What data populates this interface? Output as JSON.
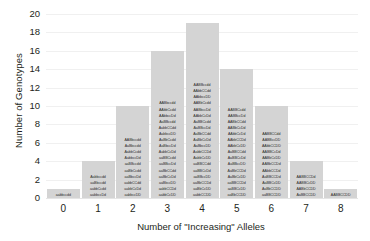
{
  "chart_data": {
    "type": "bar",
    "title": "",
    "xlabel": "Number of \"Increasing\" Alleles",
    "ylabel": "Number of Genotypes",
    "categories": [
      "0",
      "1",
      "2",
      "3",
      "4",
      "5",
      "6",
      "7",
      "8"
    ],
    "values": [
      1,
      4,
      10,
      16,
      19,
      14,
      10,
      4,
      1
    ],
    "ylim": [
      0,
      20
    ],
    "yticks": [
      "0",
      "2",
      "4",
      "6",
      "8",
      "10",
      "12",
      "14",
      "16",
      "18",
      "20"
    ],
    "ytick_values": [
      0,
      2,
      4,
      6,
      8,
      10,
      12,
      14,
      16,
      18,
      20
    ],
    "grid": true,
    "legend": "none",
    "bar_color": "#d4d4d4",
    "background_color": "#ffffff",
    "bar_labels": [
      [
        "aabbccdd"
      ],
      [
        "Aabbccdd",
        "aaBbccdd",
        "aabbCcdd",
        "aabbccDd"
      ],
      [
        "AABbccdd",
        "AaBbccdd",
        "AabbCcdd",
        "AabbccDd",
        "aaBBccdd",
        "aaBbCcdd",
        "aaBbccDd",
        "aabbCCdd",
        "aabbCcDd",
        "aabbccDD"
      ],
      [
        "AABbccdd",
        "AAbbCcdd",
        "AAbbccDd",
        "AaBBccdd",
        "AabbCCdd",
        "AabbccDD",
        "AaBbCcdd",
        "AaBbccDd",
        "AabbCcDd",
        "aaBBCcdd",
        "aaBBccDd",
        "aaBbCCdd",
        "aaBbCcDd",
        "aaBbccDD",
        "aabbCCDd",
        "aabbCcDD"
      ],
      [
        "AABBccdd",
        "AAbbCCdd",
        "AAbbccDD",
        "AABbCcdd",
        "AABbccDd",
        "AAbbCcDd",
        "AaBBCcdd",
        "AaBBccDd",
        "AaBbCCdd",
        "AaBbCcDd",
        "AaBbccDD",
        "AabbCCDd",
        "AabbCcDD",
        "aaBBCCdd",
        "aaBBCcDd",
        "aaBBccDD",
        "aaBbCCDd",
        "aaBbCcDD",
        "aabbCCDD"
      ],
      [
        "AABBCcdd",
        "AABBccDd",
        "AABbCCdd",
        "AABbCcDd",
        "AAbbCcDd",
        "AAbbCCDd",
        "AAbbCcDD",
        "AaBBCCdd",
        "AaBBCcDd",
        "AaBBccDD",
        "AaBbCCDd",
        "AaBbCcDD",
        "aaBBCCDd",
        "aaBBCcDD",
        "aaBbCCDD"
      ],
      [
        "AABBCCdd",
        "AABBccDD",
        "AAbbCCDD",
        "AABBCcDd",
        "AABbCcDD",
        "AABbCCDd",
        "AAbbCCDd",
        "AaBBCCDd",
        "AaBBCcDD",
        "AaBbCCDD",
        "aaBBCCDD"
      ],
      [
        "AABBCCDd",
        "AABBCcDD",
        "AABbCCDD",
        "AaBBCCDD"
      ],
      [
        "AABBCCDD"
      ]
    ]
  }
}
